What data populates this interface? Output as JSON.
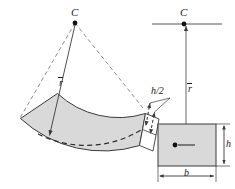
{
  "figure": {
    "colors": {
      "fill": "#d9d9d9",
      "stroke": "#3a3a3a",
      "text": "#1a1a1a",
      "background": "#ffffff"
    },
    "left_view": {
      "center_label": "C",
      "radius_label": "r",
      "radius_overbar": true,
      "callout_label": "h/2"
    },
    "right_view": {
      "center_label": "C",
      "radius_label": "r",
      "radius_overbar": true,
      "width_label": "b",
      "height_label": "h"
    }
  }
}
